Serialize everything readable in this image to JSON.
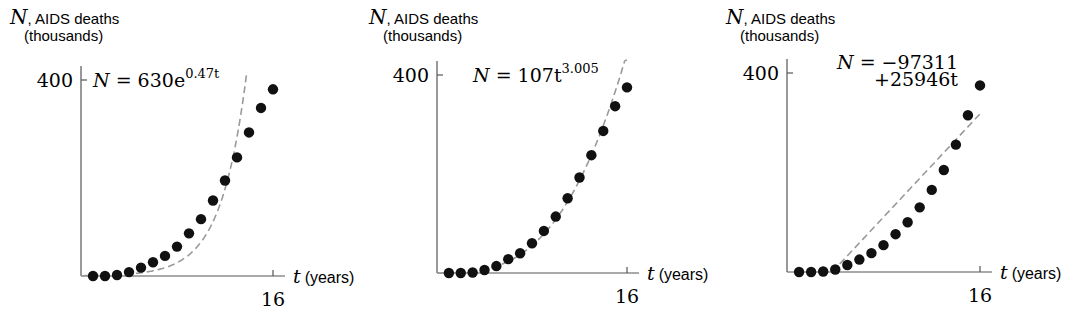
{
  "chart_data": [
    {
      "type": "scatter",
      "title": "",
      "ylabel_var": "N",
      "ylabel": "AIDS deaths",
      "ylabel_unit": "(thousands)",
      "xlabel_var": "t",
      "xlabel": "(years)",
      "ytick": "400",
      "xtick": "16",
      "xlim": [
        0,
        16
      ],
      "ylim": [
        0,
        400
      ],
      "x": [
        1,
        2,
        3,
        4,
        5,
        6,
        7,
        8,
        9,
        10,
        11,
        12,
        13,
        14,
        15,
        16
      ],
      "values": [
        0,
        0,
        2,
        8,
        17,
        28,
        41,
        60,
        87,
        116,
        154,
        195,
        242,
        293,
        343,
        381
      ],
      "fit": {
        "kind": "exponential",
        "label": "N = 630e^{0.47t}",
        "eq_main": "N = 630e",
        "eq_sup": "0.47t",
        "a": 0.63,
        "b": 0.47
      },
      "grid": false
    },
    {
      "type": "scatter",
      "title": "",
      "ylabel_var": "N",
      "ylabel": "AIDS deaths",
      "ylabel_unit": "(thousands)",
      "xlabel_var": "t",
      "xlabel": "(years)",
      "ytick": "400",
      "xtick": "16",
      "xlim": [
        0,
        16
      ],
      "ylim": [
        0,
        400
      ],
      "x": [
        1,
        2,
        3,
        4,
        5,
        6,
        7,
        8,
        9,
        10,
        11,
        12,
        13,
        14,
        15,
        16
      ],
      "values": [
        0,
        0,
        1,
        6,
        14,
        28,
        40,
        60,
        85,
        114,
        151,
        193,
        238,
        287,
        337,
        375
      ],
      "fit": {
        "kind": "power",
        "label": "N = 107t^{3.005}",
        "eq_main": "N = 107t",
        "eq_sup": "3.005",
        "a": 0.107,
        "b": 3.005
      },
      "grid": false
    },
    {
      "type": "scatter",
      "title": "",
      "ylabel_var": "N",
      "ylabel": "AIDS deaths",
      "ylabel_unit": "(thousands)",
      "xlabel_var": "t",
      "xlabel": "(years)",
      "ytick": "400",
      "xtick": "16",
      "xlim": [
        0,
        16
      ],
      "ylim": [
        0,
        400
      ],
      "x": [
        1,
        2,
        3,
        4,
        5,
        6,
        7,
        8,
        9,
        10,
        11,
        12,
        13,
        14,
        15,
        16
      ],
      "values": [
        0,
        0,
        1,
        5,
        14,
        25,
        38,
        54,
        76,
        100,
        130,
        165,
        205,
        256,
        315,
        375
      ],
      "fit": {
        "kind": "linear",
        "label": "N = −97311 +25946t",
        "eq_line1": "N = −97311",
        "eq_line2": "+25946t",
        "intercept": -97.311,
        "slope": 25.946
      },
      "grid": false
    }
  ]
}
